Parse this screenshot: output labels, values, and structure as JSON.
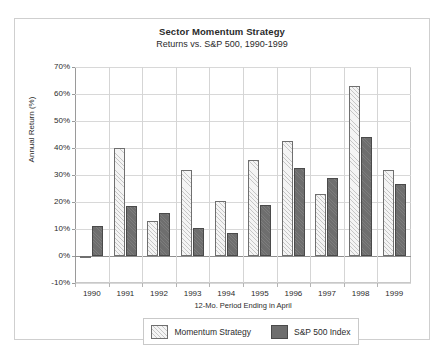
{
  "chart_data": {
    "type": "bar",
    "title": "Sector Momentum Strategy",
    "subtitle": "Returns vs. S&P 500, 1990-1999",
    "xlabel": "12-Mo. Period Ending in April",
    "ylabel": "Annual Return (%)",
    "categories": [
      "1990",
      "1991",
      "1992",
      "1993",
      "1994",
      "1995",
      "1996",
      "1997",
      "1998",
      "1999"
    ],
    "series": [
      {
        "name": "Momentum Strategy",
        "color": "#f4f4f4",
        "pattern": "diagonal-hatch",
        "values": [
          0,
          40,
          13,
          32,
          20.5,
          35.5,
          42.5,
          23,
          63,
          32
        ]
      },
      {
        "name": "S&P 500 Index",
        "color": "#6e6e6e",
        "pattern": "solid",
        "values": [
          11,
          18.5,
          16,
          10.5,
          8.5,
          19,
          32.5,
          29,
          44,
          26.5
        ]
      }
    ],
    "ylim": [
      -10,
      70
    ],
    "ytick_step": 10,
    "ytick_labels": [
      "70%",
      "60%",
      "50%",
      "40%",
      "30%",
      "20%",
      "10%",
      "0%",
      "-10%"
    ],
    "ytick_values": [
      70,
      60,
      50,
      40,
      30,
      20,
      10,
      0,
      -10
    ],
    "grid": "horizontal-and-category-separators",
    "legend_position": "bottom-center"
  },
  "legend": {
    "entries": [
      {
        "label": "Momentum Strategy"
      },
      {
        "label": "S&P 500 Index"
      }
    ]
  }
}
